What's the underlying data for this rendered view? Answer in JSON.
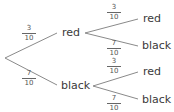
{
  "tree": {
    "level1": [
      {
        "label": "red",
        "prob_num": "3",
        "prob_den": "10"
      },
      {
        "label": "black",
        "prob_num": "7",
        "prob_den": "10"
      }
    ],
    "level2": [
      {
        "parent": "red",
        "label": "red",
        "prob_num": "3",
        "prob_den": "10"
      },
      {
        "parent": "red",
        "label": "black",
        "prob_num": "7",
        "prob_den": "10"
      },
      {
        "parent": "black",
        "label": "red",
        "prob_num": "3",
        "prob_den": "10"
      },
      {
        "parent": "black",
        "label": "black",
        "prob_num": "7",
        "prob_den": "10"
      }
    ],
    "line_color": "#8a8a8a"
  }
}
